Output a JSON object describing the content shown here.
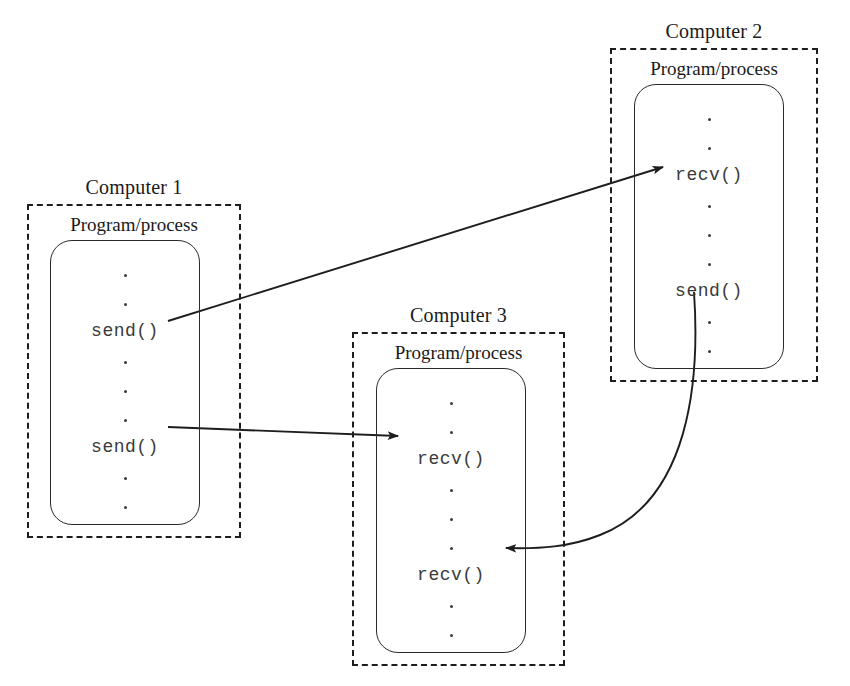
{
  "figure": {
    "background_color": "#ffffff",
    "line_color": "#1d1d1d",
    "code_text_color": "#3a3a3a"
  },
  "computers": [
    {
      "id": "computer-1",
      "label": "Computer 1",
      "process_label": "Program/process",
      "box": {
        "x": 27,
        "y": 204,
        "w": 214,
        "h": 334
      },
      "process_box": {
        "x": 50,
        "y": 240,
        "w": 150,
        "h": 285
      },
      "code": [
        {
          "kind": "dot",
          "text": "."
        },
        {
          "kind": "dot",
          "text": "."
        },
        {
          "kind": "call",
          "text": "send()"
        },
        {
          "kind": "dot",
          "text": "."
        },
        {
          "kind": "dot",
          "text": "."
        },
        {
          "kind": "dot",
          "text": "."
        },
        {
          "kind": "call",
          "text": "send()"
        },
        {
          "kind": "dot",
          "text": "."
        },
        {
          "kind": "dot",
          "text": "."
        }
      ]
    },
    {
      "id": "computer-2",
      "label": "Computer 2",
      "process_label": "Program/process",
      "box": {
        "x": 610,
        "y": 48,
        "w": 208,
        "h": 334
      },
      "process_box": {
        "x": 634,
        "y": 84,
        "w": 150,
        "h": 285
      },
      "code": [
        {
          "kind": "dot",
          "text": "."
        },
        {
          "kind": "dot",
          "text": "."
        },
        {
          "kind": "call",
          "text": "recv()"
        },
        {
          "kind": "dot",
          "text": "."
        },
        {
          "kind": "dot",
          "text": "."
        },
        {
          "kind": "dot",
          "text": "."
        },
        {
          "kind": "call",
          "text": "send()"
        },
        {
          "kind": "dot",
          "text": "."
        },
        {
          "kind": "dot",
          "text": "."
        }
      ]
    },
    {
      "id": "computer-3",
      "label": "Computer 3",
      "process_label": "Program/process",
      "box": {
        "x": 352,
        "y": 332,
        "w": 213,
        "h": 334
      },
      "process_box": {
        "x": 376,
        "y": 368,
        "w": 150,
        "h": 285
      },
      "code": [
        {
          "kind": "dot",
          "text": "."
        },
        {
          "kind": "dot",
          "text": "."
        },
        {
          "kind": "call",
          "text": "recv()"
        },
        {
          "kind": "dot",
          "text": "."
        },
        {
          "kind": "dot",
          "text": "."
        },
        {
          "kind": "dot",
          "text": "."
        },
        {
          "kind": "call",
          "text": "recv()"
        },
        {
          "kind": "dot",
          "text": "."
        },
        {
          "kind": "dot",
          "text": "."
        }
      ]
    }
  ],
  "arrows": [
    {
      "id": "arrow-c1-send-to-c2-recv",
      "from": "Computer 1 send()",
      "to": "Computer 2 recv()",
      "style": "straight",
      "path": "M 168 321 L 663 167"
    },
    {
      "id": "arrow-c1-send-to-c3-recv",
      "from": "Computer 1 send()",
      "to": "Computer 3 recv()",
      "style": "straight",
      "path": "M 168 427 L 398 436"
    },
    {
      "id": "arrow-c2-send-to-c3-recv",
      "from": "Computer 2 send()",
      "to": "Computer 3 recv()",
      "style": "curved",
      "path": "M 694 292 C 700 380 690 500 600 535 C 570 547 540 549 506 548"
    }
  ]
}
